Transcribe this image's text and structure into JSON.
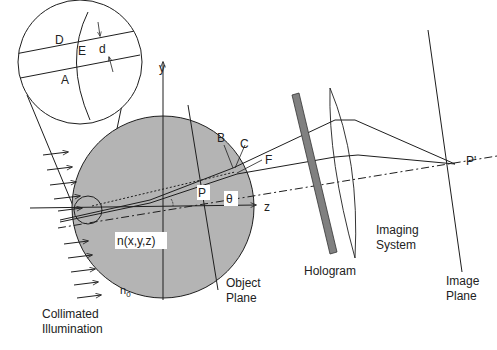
{
  "diagram": {
    "type": "optical-schematic",
    "colors": {
      "object_fill": "#b4b4b4",
      "hologram_fill": "#808080",
      "line": "#1e1e1e",
      "background": "#ffffff"
    },
    "labels": {
      "D": "D",
      "E": "E",
      "d": "d",
      "A": "A",
      "y_axis": "y",
      "z_axis": "z",
      "B": "B",
      "C": "C",
      "F": "F",
      "P": "P",
      "theta": "θ",
      "refractive_index": "n(x,y,z)",
      "n0": "n",
      "n0_sub": "0",
      "collimated_1": "Collimated",
      "collimated_2": "Illumination",
      "object_plane_1": "Object",
      "object_plane_2": "Plane",
      "hologram": "Hologram",
      "imaging_1": "Imaging",
      "imaging_2": "System",
      "image_plane_1": "Image",
      "image_plane_2": "Plane",
      "P_prime": "P'"
    }
  }
}
